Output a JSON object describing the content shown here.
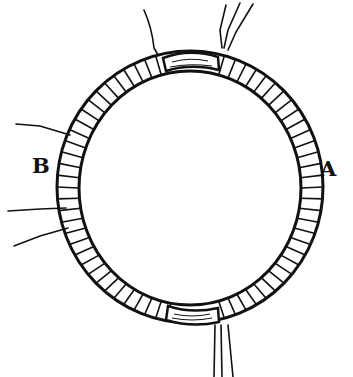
{
  "figure": {
    "labels": {
      "left": "B",
      "right": "A"
    },
    "colors": {
      "ink": "#111111",
      "background": "#ffffff"
    }
  }
}
